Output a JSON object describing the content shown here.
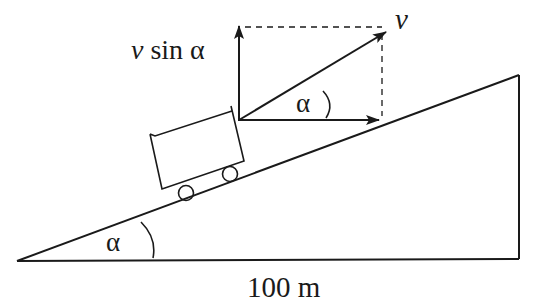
{
  "diagram": {
    "type": "physics-inclined-plane",
    "labels": {
      "velocity": "v",
      "vertical_component_v": "v",
      "vertical_component_rest": " sin α",
      "angle_upper": "α",
      "angle_lower": "α",
      "base_length": "100 m"
    },
    "colors": {
      "stroke": "#1a1a1a",
      "background": "#ffffff"
    }
  }
}
